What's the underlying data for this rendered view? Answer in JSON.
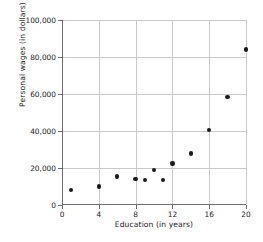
{
  "chart_data": {
    "type": "scatter",
    "title": "",
    "xlabel": "Education (in years)",
    "ylabel": "Personal wages (in dollars)",
    "xlim": [
      0,
      20
    ],
    "ylim": [
      0,
      100000
    ],
    "xticks": [
      0,
      4,
      8,
      12,
      16,
      20
    ],
    "xtick_labels": [
      "0",
      "4",
      "8",
      "12",
      "16",
      "20"
    ],
    "yticks": [
      0,
      20000,
      40000,
      60000,
      80000,
      100000
    ],
    "ytick_labels": [
      "0",
      "20,000",
      "40,000",
      "60,000",
      "80,000",
      "100,000"
    ],
    "grid": true,
    "legend": null,
    "marker": "filled-circle",
    "marker_color": "#1a1a1a",
    "grid_color": "#c9c9c9",
    "axis_color": "#6e6e6e",
    "points": [
      {
        "x": 1,
        "y": 8000
      },
      {
        "x": 4,
        "y": 10000
      },
      {
        "x": 6,
        "y": 15500
      },
      {
        "x": 8,
        "y": 14000
      },
      {
        "x": 9,
        "y": 13500
      },
      {
        "x": 10,
        "y": 18800
      },
      {
        "x": 11,
        "y": 13500
      },
      {
        "x": 12,
        "y": 22500
      },
      {
        "x": 14,
        "y": 27800
      },
      {
        "x": 16,
        "y": 40500
      },
      {
        "x": 18,
        "y": 58500
      },
      {
        "x": 20,
        "y": 84000
      }
    ]
  }
}
